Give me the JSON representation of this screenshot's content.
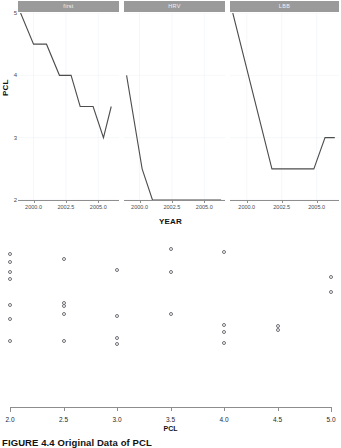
{
  "facet_chart": {
    "ylabel": "PCL",
    "xlabel": "YEAR",
    "yticks": [
      "5",
      "4",
      "3",
      "2"
    ],
    "xticks": [
      "2000.0",
      "2002.5",
      "2005.0"
    ],
    "strip_bg": "#9a9a9a",
    "line_color": "#4d4d4d",
    "panels": [
      {
        "label": "first",
        "name": "panel-1"
      },
      {
        "label": "HRV",
        "name": "panel-2"
      },
      {
        "label": "LBB",
        "name": "panel-3"
      }
    ]
  },
  "dot_chart": {
    "xlabel": "PCL",
    "xticks": [
      "2.0",
      "2.5",
      "3.0",
      "3.5",
      "4.0",
      "4.5",
      "5.0"
    ],
    "point_color": "#6f6f77"
  },
  "caption": {
    "text": "FIGURE 4.4 Original Data of PCL"
  },
  "chart_data": [
    {
      "type": "line",
      "name": "faceted-pcl-by-year",
      "title": "",
      "xlabel": "YEAR",
      "ylabel": "PCL",
      "ylim": [
        2,
        5
      ],
      "xlim": [
        1998.8,
        2006.6
      ],
      "xticks": [
        2000.0,
        2002.5,
        2005.0
      ],
      "yticks": [
        2,
        3,
        4,
        5
      ],
      "grid": true,
      "legend": "none",
      "facets": [
        {
          "label": "first",
          "x": [
            1999.0,
            2000.0,
            2001.0,
            2002.0,
            2002.9,
            2003.6,
            2004.6,
            2005.4,
            2006.0
          ],
          "y": [
            5.0,
            4.5,
            4.5,
            4.0,
            4.0,
            3.5,
            3.5,
            3.0,
            3.5
          ]
        },
        {
          "label": "HRV",
          "x": [
            1999.0,
            2000.2,
            2001.0,
            2006.3
          ],
          "y": [
            4.0,
            2.5,
            2.0,
            2.0
          ]
        },
        {
          "label": "LBB",
          "x": [
            1999.0,
            2001.8,
            2004.8,
            2005.6,
            2006.3
          ],
          "y": [
            5.0,
            2.5,
            2.5,
            3.0,
            3.0
          ]
        }
      ]
    },
    {
      "type": "scatter",
      "name": "pcl-strip-plot",
      "title": "",
      "xlabel": "PCL",
      "ylabel": "",
      "xlim": [
        2.0,
        5.0
      ],
      "xticks": [
        2.0,
        2.5,
        3.0,
        3.5,
        4.0,
        4.5,
        5.0
      ],
      "grid": false,
      "legend": "none",
      "points": [
        {
          "x": 2.0,
          "jitter": 0.93
        },
        {
          "x": 2.0,
          "jitter": 0.86
        },
        {
          "x": 2.0,
          "jitter": 0.77
        },
        {
          "x": 2.0,
          "jitter": 0.71
        },
        {
          "x": 2.0,
          "jitter": 0.48
        },
        {
          "x": 2.0,
          "jitter": 0.36
        },
        {
          "x": 2.0,
          "jitter": 0.17
        },
        {
          "x": 2.5,
          "jitter": 0.89
        },
        {
          "x": 2.5,
          "jitter": 0.5
        },
        {
          "x": 2.5,
          "jitter": 0.47
        },
        {
          "x": 2.5,
          "jitter": 0.4
        },
        {
          "x": 2.5,
          "jitter": 0.17
        },
        {
          "x": 3.0,
          "jitter": 0.79
        },
        {
          "x": 3.0,
          "jitter": 0.39
        },
        {
          "x": 3.0,
          "jitter": 0.19
        },
        {
          "x": 3.0,
          "jitter": 0.14
        },
        {
          "x": 3.5,
          "jitter": 0.97
        },
        {
          "x": 3.5,
          "jitter": 0.77
        },
        {
          "x": 3.5,
          "jitter": 0.4
        },
        {
          "x": 4.0,
          "jitter": 0.95
        },
        {
          "x": 4.0,
          "jitter": 0.31
        },
        {
          "x": 4.0,
          "jitter": 0.25
        },
        {
          "x": 4.0,
          "jitter": 0.15
        },
        {
          "x": 4.5,
          "jitter": 0.3
        },
        {
          "x": 4.5,
          "jitter": 0.26
        },
        {
          "x": 5.0,
          "jitter": 0.73
        },
        {
          "x": 5.0,
          "jitter": 0.6
        }
      ]
    }
  ]
}
